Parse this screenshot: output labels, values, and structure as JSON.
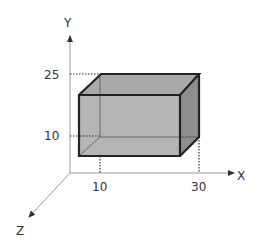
{
  "axes": {
    "x_label": "X",
    "y_label": "Y",
    "z_label": "Z"
  },
  "ticks": {
    "x": [
      "10",
      "30"
    ],
    "y": [
      "10",
      "25"
    ]
  },
  "box": {
    "x_range": [
      10,
      30
    ],
    "y_range": [
      10,
      25
    ],
    "colors": {
      "front": "#b5b5b5",
      "top": "#a9a9a9",
      "side": "#8e8e8e",
      "edge": "#222222",
      "hidden_edge": "#555555",
      "axis": "#999999"
    }
  }
}
